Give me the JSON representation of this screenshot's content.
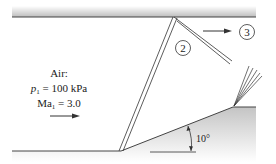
{
  "diagram": {
    "type": "oblique shock reflection in a channel with ramp",
    "inlet": {
      "fluid_label": "Air:",
      "pressure_label": "p",
      "pressure_sub": "1",
      "pressure_value": " = 100 kPa",
      "mach_label": "Ma",
      "mach_sub": "1",
      "mach_value": " = 3.0"
    },
    "regions": {
      "region_2": "2",
      "region_3": "3"
    },
    "ramp_angle": "10°",
    "colors": {
      "wall_dark": "#555555",
      "wall_light": "#d8d8d8",
      "line": "#333333"
    }
  }
}
